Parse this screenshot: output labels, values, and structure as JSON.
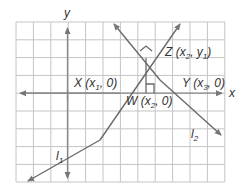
{
  "diagram": {
    "axes": {
      "x_label": "x",
      "y_label": "y"
    },
    "lines": [
      {
        "name": "l",
        "sub": "1"
      },
      {
        "name": "l",
        "sub": "2"
      }
    ],
    "points": {
      "X": {
        "name": "X",
        "coord_open": " (x",
        "sub": "1",
        "coord_close": ", 0)"
      },
      "Y": {
        "name": "Y",
        "coord_open": " (x",
        "sub": "3",
        "coord_close": ", 0)"
      },
      "W": {
        "name": "W",
        "coord_open": " (x",
        "sub": "2",
        "coord_close": ", 0)"
      },
      "Z": {
        "name": "Z",
        "coord_open": " (x",
        "sub": "2",
        "mid": ", y",
        "sub2": "1",
        "coord_close": ")"
      }
    },
    "colors": {
      "grid": "#bdbdbd",
      "axis": "#888888",
      "line": "#6a6a6a",
      "text": "#333333"
    }
  }
}
